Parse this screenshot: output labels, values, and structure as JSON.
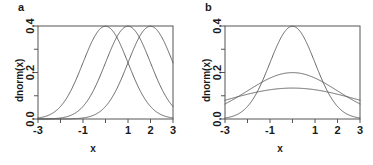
{
  "figure": {
    "background": "#ffffff",
    "line_color": "#555555",
    "axis_color": "#555555",
    "text_color": "#1a1a1a"
  },
  "panels": [
    {
      "label": "a",
      "xlabel": "x",
      "ylabel": "dnorm(x)"
    },
    {
      "label": "b",
      "xlabel": "x",
      "ylabel": "dnorm(x)"
    }
  ],
  "chart_data": [
    {
      "type": "line",
      "title": "a",
      "xlabel": "x",
      "ylabel": "dnorm(x)",
      "xlim": [
        -3,
        3
      ],
      "ylim": [
        0,
        0.4
      ],
      "xticks": [
        -3,
        -2,
        -1,
        0,
        1,
        2,
        3
      ],
      "xticklabels": [
        "-3",
        "",
        "-1",
        "",
        "1",
        "2",
        "3"
      ],
      "yticks": [
        0.0,
        0.1,
        0.2,
        0.3,
        0.4
      ],
      "yticklabels": [
        "0.0",
        "",
        "0.2",
        "",
        "0.4"
      ],
      "grid": false,
      "legend": "none",
      "series": [
        {
          "name": "mean = 0, sd = 1",
          "distribution": "normal",
          "mean": 0,
          "sd": 1,
          "peak_x": 0,
          "peak_y": 0.3989
        },
        {
          "name": "mean = 1, sd = 1",
          "distribution": "normal",
          "mean": 1,
          "sd": 1,
          "peak_x": 1,
          "peak_y": 0.3989
        },
        {
          "name": "mean = 2, sd = 1",
          "distribution": "normal",
          "mean": 2,
          "sd": 1,
          "peak_x": 2,
          "peak_y": 0.3989
        }
      ]
    },
    {
      "type": "line",
      "title": "b",
      "xlabel": "x",
      "ylabel": "dnorm(x)",
      "xlim": [
        -3,
        3
      ],
      "ylim": [
        0,
        0.4
      ],
      "xticks": [
        -3,
        -2,
        -1,
        0,
        1,
        2,
        3
      ],
      "xticklabels": [
        "-3",
        "",
        "-1",
        "",
        "1",
        "2",
        "3"
      ],
      "yticks": [
        0.0,
        0.1,
        0.2,
        0.3,
        0.4
      ],
      "yticklabels": [
        "0.0",
        "",
        "0.2",
        "",
        "0.4"
      ],
      "grid": false,
      "legend": "none",
      "series": [
        {
          "name": "mean = 0, sd = 1",
          "distribution": "normal",
          "mean": 0,
          "sd": 1,
          "peak_x": 0,
          "peak_y": 0.3989
        },
        {
          "name": "mean = 0, sd = 2",
          "distribution": "normal",
          "mean": 0,
          "sd": 2,
          "peak_x": 0,
          "peak_y": 0.1995
        },
        {
          "name": "mean = 0, sd = 3",
          "distribution": "normal",
          "mean": 0,
          "sd": 3,
          "peak_x": 0,
          "peak_y": 0.133
        }
      ]
    }
  ]
}
